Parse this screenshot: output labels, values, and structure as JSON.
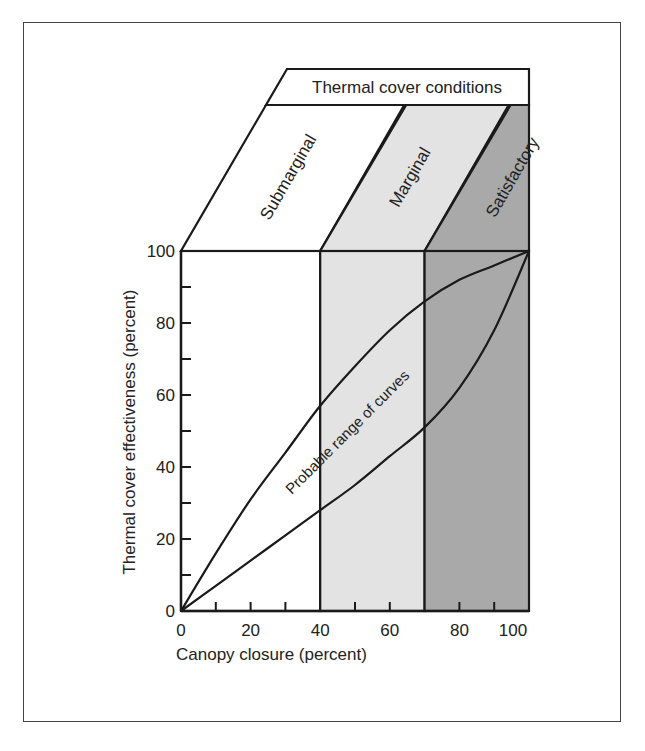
{
  "chart_data": {
    "type": "line",
    "title": "Thermal cover conditions",
    "xlabel": "Canopy closure (percent)",
    "ylabel": "Thermal cover effectiveness (percent)",
    "xlim": [
      0,
      100
    ],
    "ylim": [
      0,
      100
    ],
    "x_ticks": [
      0,
      20,
      40,
      60,
      80,
      100
    ],
    "y_ticks": [
      0,
      20,
      40,
      60,
      80,
      100
    ],
    "x_minor_ticks": [
      10,
      20,
      30,
      50,
      60,
      80,
      90
    ],
    "y_minor_ticks": [
      10,
      20,
      30,
      40,
      50,
      60,
      70,
      80,
      90
    ],
    "grid": false,
    "zones": [
      {
        "name": "Submarginal",
        "x_start": 0,
        "x_end": 40,
        "color": "#ffffff"
      },
      {
        "name": "Marginal",
        "x_start": 40,
        "x_end": 70,
        "color": "#e3e3e3"
      },
      {
        "name": "Satisfactory",
        "x_start": 70,
        "x_end": 100,
        "color": "#a9a9a9"
      }
    ],
    "series": [
      {
        "name": "Upper bound curve",
        "x": [
          0,
          10,
          20,
          30,
          40,
          50,
          60,
          70,
          80,
          90,
          100
        ],
        "y": [
          0,
          16,
          31,
          44,
          57,
          68,
          78,
          86,
          92,
          96,
          100
        ]
      },
      {
        "name": "Lower bound curve",
        "x": [
          0,
          10,
          20,
          30,
          40,
          50,
          60,
          70,
          80,
          90,
          100
        ],
        "y": [
          0,
          7,
          14,
          21,
          28,
          35,
          43,
          51,
          62,
          78,
          100
        ]
      }
    ],
    "annotations": [
      {
        "text": "Probable range of curves",
        "x": 50,
        "y": 52,
        "rotation": -45
      }
    ]
  }
}
